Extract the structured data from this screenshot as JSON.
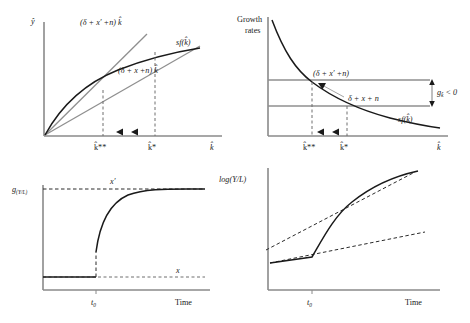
{
  "figure": {
    "panels": [
      {
        "id": "top-left",
        "name": "output-per-effective-worker-panel",
        "yaxis_label": "ŷ",
        "xaxis_label": "k̂",
        "curves": [
          {
            "name": "production-curve",
            "label": "sf(k̂)"
          },
          {
            "name": "new-breakeven-line",
            "label": "(δ + x′ +n) k̂"
          },
          {
            "name": "old-breakeven-line",
            "label": "(δ + x +n) k̂"
          }
        ],
        "x_ticks": [
          "k̂**",
          "k̂*"
        ],
        "arrows": "two left-pointing arrows between k̂* and k̂**"
      },
      {
        "id": "top-right",
        "name": "growth-rates-panel",
        "yaxis_label_line1": "Growth",
        "yaxis_label_line2": "rates",
        "xaxis_label": "k̂",
        "curves": [
          {
            "name": "sf-over-k-curve",
            "label": "sf(k̂)"
          },
          {
            "name": "new-breakeven-level",
            "label": "(δ + x′ +n)"
          },
          {
            "name": "old-breakeven-level",
            "label": "δ + x + n"
          }
        ],
        "annotation": "g k̂ < 0",
        "annotation_main": "g",
        "annotation_sub": "k̂",
        "annotation_tail": " < 0",
        "x_ticks": [
          "k̂**",
          "k̂*"
        ],
        "arrows": "two left-pointing arrows between k̂* and k̂**"
      },
      {
        "id": "bottom-left",
        "name": "growth-rate-of-output-per-worker-panel",
        "yaxis_label": "g",
        "yaxis_label_sub": "(Y/L)",
        "xaxis_label": "Time",
        "level_high_label": "x′",
        "level_low_label": "x",
        "x_tick": "t",
        "x_tick_sub": "0"
      },
      {
        "id": "bottom-right",
        "name": "log-output-per-worker-panel",
        "yaxis_label": "log(Y/L)",
        "xaxis_label": "Time",
        "x_tick": "t",
        "x_tick_sub": "0",
        "lines": [
          {
            "name": "actual-path",
            "style": "solid"
          },
          {
            "name": "new-trend-line",
            "style": "dashed"
          },
          {
            "name": "old-trend-line",
            "style": "dashed"
          }
        ]
      }
    ],
    "colors": {
      "axis": "#8a8a8a",
      "curve_dark": "#1a1a1a",
      "curve_mid": "#6f6f6f",
      "line_gray": "#8f8f8f",
      "background": "#ffffff"
    }
  }
}
